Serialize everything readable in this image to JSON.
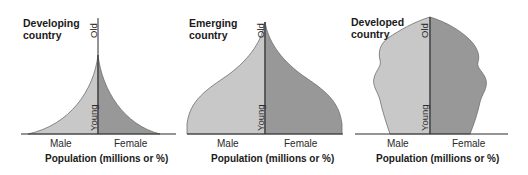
{
  "colors": {
    "male_fill": "#c8c8c8",
    "female_fill": "#989898",
    "outline": "#6e6e6e",
    "axis": "#2b2b2b"
  },
  "panels": [
    {
      "title_line1": "Developing",
      "title_line2": "country",
      "old_label": "Old",
      "young_label": "Young",
      "male_label": "Male",
      "female_label": "Female",
      "xlabel": "Population (millions or %)"
    },
    {
      "title_line1": "Emerging",
      "title_line2": "country",
      "old_label": "Old",
      "young_label": "Young",
      "male_label": "Male",
      "female_label": "Female",
      "xlabel": "Population (millions or %)"
    },
    {
      "title_line1": "Developed",
      "title_line2": "country",
      "old_label": "Old",
      "young_label": "Young",
      "male_label": "Male",
      "female_label": "Female",
      "xlabel": "Population (millions or %)"
    }
  ]
}
